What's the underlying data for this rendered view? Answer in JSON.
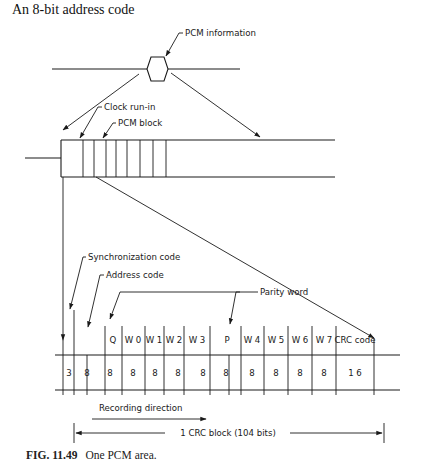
{
  "header": {
    "title": "An 8-bit address code"
  },
  "diagram": {
    "labels": {
      "pcm_information": "PCM information",
      "clock_run_in": "Clock run-in",
      "pcm_block": "PCM block",
      "synchronization_code": "Synchronization code",
      "address_code": "Address code",
      "parity_word": "Parity word",
      "recording_direction": "Recording direction",
      "crc_block": "1 CRC block (104 bits)"
    },
    "block_fields": [
      {
        "name": "Sync",
        "label": "",
        "bits": "3"
      },
      {
        "name": "Address",
        "label": "",
        "bits": "8"
      },
      {
        "name": "Q",
        "label": "Q",
        "bits": "8"
      },
      {
        "name": "W0",
        "label": "W 0",
        "bits": "8"
      },
      {
        "name": "W1",
        "label": "W 1",
        "bits": "8"
      },
      {
        "name": "W2",
        "label": "W 2",
        "bits": "8"
      },
      {
        "name": "W3",
        "label": "W 3",
        "bits": "8"
      },
      {
        "name": "P",
        "label": "P",
        "bits": "8"
      },
      {
        "name": "W4",
        "label": "W 4",
        "bits": "8"
      },
      {
        "name": "W5",
        "label": "W 5",
        "bits": "8"
      },
      {
        "name": "W6",
        "label": "W 6",
        "bits": "8"
      },
      {
        "name": "W7",
        "label": "W 7",
        "bits": "8"
      },
      {
        "name": "CRC",
        "label": "CRC code",
        "bits": "1 6"
      }
    ],
    "total_bits": 104
  },
  "caption": {
    "figure_number": "FIG. 11.49",
    "text": "One PCM area."
  }
}
